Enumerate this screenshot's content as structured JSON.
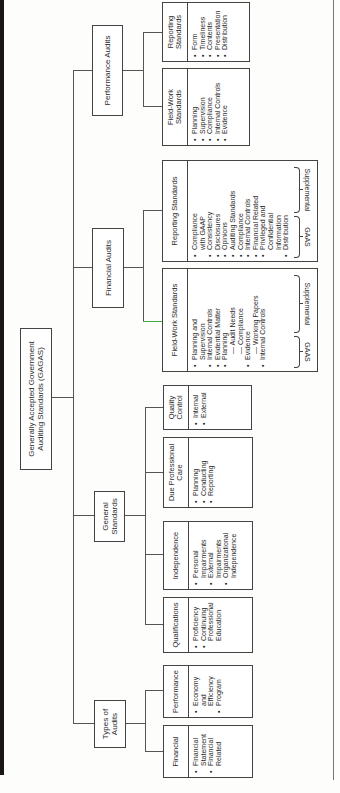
{
  "diagram": {
    "root": {
      "label": "Generally Accepted Government Auditing Standards (GAGAS)"
    },
    "branches": {
      "performance_audits": {
        "label": "Performance Audits",
        "field_work": {
          "title": "Field-Work Standards",
          "items": [
            "Planning",
            "Supervision",
            "Compliance",
            "Internal Controls",
            "Evidence"
          ]
        },
        "reporting": {
          "title": "Reporting Standards",
          "items": [
            "Form",
            "Timeliness",
            "Contents",
            "Presentation",
            "Distribution"
          ]
        }
      },
      "financial_audits": {
        "label": "Financial Audits",
        "field_work": {
          "title": "Field-Work Standards",
          "items": [
            {
              "text": "Planning and",
              "bullet": true
            },
            {
              "text": "Supervision",
              "bullet": false
            },
            {
              "text": "Internal Controls",
              "bullet": true
            },
            {
              "text": "Evidential Matter",
              "bullet": true
            },
            {
              "text": "Planning",
              "bullet": true
            },
            {
              "text": "— Audit Needs",
              "bullet": false,
              "sub": true
            },
            {
              "text": "— Compliance",
              "bullet": false,
              "sub": true
            },
            {
              "text": "Evidence",
              "bullet": true
            },
            {
              "text": "— Working Papers",
              "bullet": false,
              "sub": true
            },
            {
              "text": "Internal Controls",
              "bullet": true
            }
          ],
          "brace_labels": {
            "gaas": "GAAS",
            "supplemental": "Supplemental"
          }
        },
        "reporting": {
          "title": "Reporting Standards",
          "items": [
            {
              "text": "Compliance",
              "bullet": true
            },
            {
              "text": "with GAAP",
              "bullet": false
            },
            {
              "text": "Consistency",
              "bullet": true
            },
            {
              "text": "Disclosures",
              "bullet": true
            },
            {
              "text": "Opinions",
              "bullet": true
            },
            {
              "text": "Auditing Standards",
              "bullet": true
            },
            {
              "text": "Compliance",
              "bullet": true
            },
            {
              "text": "Internal Controls",
              "bullet": true
            },
            {
              "text": "Financial Related",
              "bullet": true
            },
            {
              "text": "Privileged and",
              "bullet": true
            },
            {
              "text": "Confidential",
              "bullet": false
            },
            {
              "text": "Information",
              "bullet": false
            },
            {
              "text": "Distribution",
              "bullet": true
            }
          ],
          "brace_labels": {
            "gaas": "GAAS",
            "supplemental": "Supplemental"
          }
        }
      },
      "general_standards": {
        "label": "General Standards",
        "quality_control": {
          "title": "Quality Control",
          "items": [
            "Internal",
            "External"
          ]
        },
        "due_professional_care": {
          "title": "Due Professional Care",
          "items": [
            "Planning",
            "Conducting",
            "Reporting"
          ]
        },
        "independence": {
          "title": "Independence",
          "items": [
            {
              "text": "Personal",
              "bullet": true
            },
            {
              "text": "Impairments",
              "bullet": false
            },
            {
              "text": "External",
              "bullet": true
            },
            {
              "text": "Impairments",
              "bullet": false
            },
            {
              "text": "Organizational",
              "bullet": true
            },
            {
              "text": "Independence",
              "bullet": false
            }
          ]
        },
        "qualifications": {
          "title": "Qualifications",
          "items": [
            {
              "text": "Proficiency",
              "bullet": true
            },
            {
              "text": "Continuing",
              "bullet": true
            },
            {
              "text": "Professional",
              "bullet": false
            },
            {
              "text": "Education",
              "bullet": false
            }
          ]
        }
      },
      "types_of_audits": {
        "label": "Types of Audits",
        "performance": {
          "title": "Performance",
          "items": [
            {
              "text": "Economy",
              "bullet": true
            },
            {
              "text": "and",
              "bullet": false
            },
            {
              "text": "Efficiency",
              "bullet": false
            },
            {
              "text": "Program",
              "bullet": true
            }
          ]
        },
        "financial": {
          "title": "Financial",
          "items": [
            {
              "text": "Financial",
              "bullet": true
            },
            {
              "text": "Statement",
              "bullet": false
            },
            {
              "text": "Financial",
              "bullet": true
            },
            {
              "text": "Related",
              "bullet": false
            }
          ]
        }
      }
    }
  }
}
